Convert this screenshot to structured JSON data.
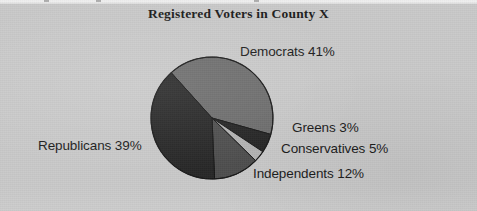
{
  "figure": {
    "background_color": "#c9c9c9",
    "width": 477,
    "height": 211
  },
  "chart_data": {
    "type": "pie",
    "title": "Registered Voters in County X",
    "xlabel": "",
    "ylabel": "",
    "legend_position": "none",
    "grid": false,
    "categories": [
      "Democrats",
      "Republicans",
      "Independents",
      "Conservatives",
      "Greens"
    ],
    "values": [
      41,
      39,
      12,
      5,
      3
    ],
    "unit": "%",
    "labels": [
      "Democrats 41%",
      "Republicans 39%",
      "Independents 12%",
      "Conservatives 5%",
      "Greens 3%"
    ],
    "slices": [
      {
        "name": "Democrats",
        "value": 41,
        "label": "Democrats 41%",
        "color": "#6c6c6c",
        "start_angle": -42,
        "end_angle": 105.6
      },
      {
        "name": "Conservatives",
        "value": 5,
        "label": "Conservatives 5%",
        "color": "#242424",
        "start_angle": 105.6,
        "end_angle": 123.6
      },
      {
        "name": "Greens",
        "value": 3,
        "label": "Greens 3%",
        "color": "#b3b3b3",
        "start_angle": 123.6,
        "end_angle": 134.4
      },
      {
        "name": "Independents",
        "value": 12,
        "label": "Independents 12%",
        "color": "#4e4e4e",
        "start_angle": 134.4,
        "end_angle": 177.6
      },
      {
        "name": "Republicans",
        "value": 39,
        "label": "Republicans 39%",
        "color": "#272727",
        "start_angle": 177.6,
        "end_angle": 318
      }
    ],
    "geometry": {
      "center_x": 212,
      "center_y": 118,
      "radius": 61
    }
  }
}
